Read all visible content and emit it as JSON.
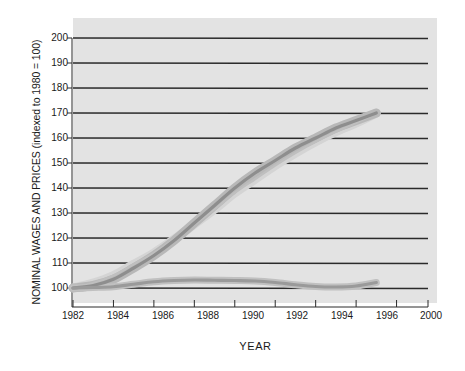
{
  "chart_data": {
    "type": "line",
    "title": "",
    "ylabel": "NOMINAL WAGES AND PRICES (indexed to 1980 = 100)",
    "xlabel": "YEAR",
    "ylim": [
      95,
      205
    ],
    "xlim": [
      1982,
      2000
    ],
    "grid": true,
    "legend_position": "inline-annotations",
    "yticks": [
      200,
      190,
      180,
      170,
      160,
      150,
      140,
      130,
      120,
      110,
      100
    ],
    "xticks": [
      "1982",
      "1984",
      "1986",
      "1988",
      "1990",
      "1992",
      "1994",
      "1996",
      "2000"
    ],
    "xtick_values": [
      1982,
      1984,
      1986,
      1988,
      1990,
      1992,
      1994,
      1996,
      1998
    ],
    "x": [
      1982,
      1983,
      1984,
      1985,
      1986,
      1987,
      1988,
      1989,
      1990,
      1991,
      1992,
      1993,
      1994,
      1995,
      1996,
      1997
    ],
    "series": [
      {
        "name": "Nominal wages",
        "label": "Nominal wages",
        "color": "#8e8e8e",
        "band_color": "#b8b8b8",
        "values": [
          100,
          101,
          103.5,
          108,
          113,
          119,
          126,
          133,
          140,
          146,
          151,
          156,
          160,
          164,
          167,
          170
        ]
      },
      {
        "name": "Prices (CPI)",
        "label_line1": "Prices",
        "label_line2": "(CPI)",
        "color": "#bfbfbf",
        "band_color": "#d4d4d4",
        "values": [
          100,
          102,
          105,
          109.5,
          114,
          119.5,
          125.5,
          131.5,
          138,
          143.5,
          149,
          154,
          158.5,
          162.5,
          166,
          170
        ]
      },
      {
        "name": "Real wage",
        "label": "Real wage",
        "color": "#9a9a9a",
        "band_color": "#c0c0c0",
        "values": [
          100,
          100.2,
          100.5,
          101.5,
          102.5,
          103,
          103.2,
          103.1,
          103,
          102.8,
          102.2,
          101.3,
          100.6,
          100.4,
          100.8,
          102.2
        ]
      }
    ],
    "annotations": [
      {
        "text": "Nominal wages",
        "x": 1990.2,
        "y": 162
      },
      {
        "text": "Prices",
        "x": 1995.6,
        "y": 145
      },
      {
        "text": "(CPI)",
        "x": 1995.6,
        "y": 141
      },
      {
        "text": "Real wage",
        "x": 1995.2,
        "y": 106
      }
    ]
  },
  "labels": {
    "ylabel": "NOMINAL WAGES AND PRICES (indexed to 1980 = 100)",
    "xlabel": "YEAR",
    "nominal_wages": "Nominal wages",
    "prices_line1": "Prices",
    "prices_line2": "(CPI)",
    "real_wage": "Real wage",
    "y200": "200",
    "y190": "190",
    "y180": "180",
    "y170": "170",
    "y160": "160",
    "y150": "150",
    "y140": "140",
    "y130": "130",
    "y120": "120",
    "y110": "110",
    "y100": "100",
    "x1982": "1982",
    "x1984": "1984",
    "x1986": "1986",
    "x1988": "1988",
    "x1990": "1990",
    "x1992": "1992",
    "x1994": "1994",
    "x1996": "1996",
    "x2000": "2000"
  },
  "colors": {
    "plot_background": "#e3e3e3",
    "gridline": "#2b2b2b",
    "text": "#1a1a1a",
    "nominal_band": "#b5b5b5",
    "nominal_line": "#8b8b8b",
    "prices_band": "#d6d6d6",
    "prices_line": "#c4c4c4",
    "real_band": "#bdbdbd",
    "real_line": "#979797"
  }
}
